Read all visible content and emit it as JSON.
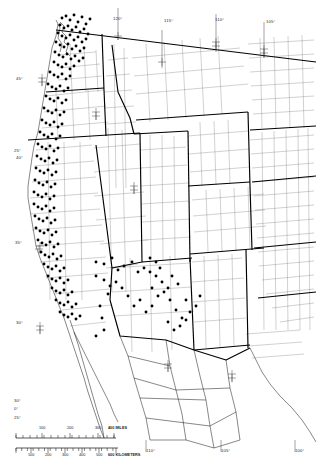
{
  "figure": {
    "name": "western-north-america-distribution-map",
    "background_color": "#ffffff",
    "ink_color": "#000000",
    "dot_color": "#000000"
  },
  "graticule": {
    "longitude_labels_top": [
      {
        "text": "120°",
        "x": 113,
        "y": 16
      },
      {
        "text": "115°",
        "x": 164,
        "y": 18
      },
      {
        "text": "110°",
        "x": 215,
        "y": 17
      },
      {
        "text": "105°",
        "x": 266,
        "y": 19
      }
    ],
    "longitude_labels_bottom": [
      {
        "text": "110°",
        "x": 146,
        "y": 448
      },
      {
        "text": "105°",
        "x": 221,
        "y": 448
      },
      {
        "text": "100°",
        "x": 295,
        "y": 448
      }
    ],
    "latitude_labels_left": [
      {
        "text": "45°",
        "x": 16,
        "y": 76
      },
      {
        "text": "25°",
        "x": 14,
        "y": 148
      },
      {
        "text": "40°",
        "x": 16,
        "y": 155
      },
      {
        "text": "35°",
        "x": 15,
        "y": 240
      },
      {
        "text": "30°",
        "x": 16,
        "y": 320
      },
      {
        "text": "30°",
        "x": 14,
        "y": 398
      },
      {
        "text": "0°",
        "x": 14,
        "y": 406
      },
      {
        "text": "25°",
        "x": 14,
        "y": 415
      }
    ],
    "tick_crosses": [
      {
        "x": 42,
        "y": 82
      },
      {
        "x": 118,
        "y": 36
      },
      {
        "x": 162,
        "y": 62
      },
      {
        "x": 216,
        "y": 46
      },
      {
        "x": 264,
        "y": 53
      },
      {
        "x": 40,
        "y": 330
      },
      {
        "x": 134,
        "y": 190
      },
      {
        "x": 168,
        "y": 368
      },
      {
        "x": 232,
        "y": 378
      },
      {
        "x": 39,
        "y": 249
      },
      {
        "x": 96,
        "y": 116
      }
    ]
  },
  "scale_bar": {
    "miles": {
      "unit_label": "400 MILES",
      "ticks": [
        "100",
        "200",
        "300"
      ],
      "tick_x": [
        28,
        56,
        84
      ],
      "end_x": 100
    },
    "kilometers": {
      "unit_label": "600 KILOMETERS",
      "ticks": [
        "100",
        "200",
        "300",
        "400",
        "500"
      ],
      "tick_x": [
        17,
        34,
        51,
        68,
        85
      ],
      "end_x": 102
    }
  },
  "chart_data": {
    "type": "scatter",
    "title": "",
    "xlabel": "Longitude",
    "ylabel": "Latitude",
    "xlim": [
      -127,
      -98
    ],
    "ylim": [
      24,
      50
    ],
    "grid": false,
    "legend": "none",
    "series": [
      {
        "name": "occurrence records",
        "marker": "filled circle",
        "color": "#000000",
        "points_pixel": [
          [
            62,
            18
          ],
          [
            66,
            16
          ],
          [
            70,
            20
          ],
          [
            74,
            15
          ],
          [
            78,
            22
          ],
          [
            82,
            17
          ],
          [
            86,
            24
          ],
          [
            90,
            19
          ],
          [
            60,
            25
          ],
          [
            64,
            28
          ],
          [
            68,
            26
          ],
          [
            72,
            30
          ],
          [
            76,
            27
          ],
          [
            80,
            32
          ],
          [
            84,
            29
          ],
          [
            88,
            34
          ],
          [
            58,
            33
          ],
          [
            62,
            36
          ],
          [
            66,
            38
          ],
          [
            70,
            35
          ],
          [
            74,
            40
          ],
          [
            78,
            37
          ],
          [
            82,
            42
          ],
          [
            86,
            39
          ],
          [
            56,
            42
          ],
          [
            60,
            45
          ],
          [
            64,
            47
          ],
          [
            68,
            44
          ],
          [
            72,
            49
          ],
          [
            76,
            46
          ],
          [
            80,
            51
          ],
          [
            84,
            48
          ],
          [
            55,
            52
          ],
          [
            59,
            55
          ],
          [
            63,
            57
          ],
          [
            67,
            54
          ],
          [
            71,
            59
          ],
          [
            75,
            56
          ],
          [
            79,
            61
          ],
          [
            83,
            58
          ],
          [
            54,
            62
          ],
          [
            58,
            65
          ],
          [
            62,
            67
          ],
          [
            66,
            64
          ],
          [
            70,
            69
          ],
          [
            74,
            66
          ],
          [
            50,
            72
          ],
          [
            54,
            75
          ],
          [
            58,
            77
          ],
          [
            62,
            74
          ],
          [
            66,
            79
          ],
          [
            70,
            76
          ],
          [
            48,
            84
          ],
          [
            52,
            87
          ],
          [
            56,
            89
          ],
          [
            60,
            86
          ],
          [
            64,
            91
          ],
          [
            68,
            88
          ],
          [
            46,
            96
          ],
          [
            50,
            99
          ],
          [
            54,
            101
          ],
          [
            58,
            98
          ],
          [
            62,
            103
          ],
          [
            66,
            100
          ],
          [
            44,
            108
          ],
          [
            48,
            111
          ],
          [
            52,
            113
          ],
          [
            56,
            110
          ],
          [
            60,
            115
          ],
          [
            64,
            112
          ],
          [
            42,
            120
          ],
          [
            46,
            123
          ],
          [
            50,
            125
          ],
          [
            54,
            122
          ],
          [
            58,
            127
          ],
          [
            62,
            124
          ],
          [
            40,
            132
          ],
          [
            44,
            135
          ],
          [
            48,
            137
          ],
          [
            52,
            134
          ],
          [
            56,
            139
          ],
          [
            60,
            136
          ],
          [
            38,
            144
          ],
          [
            42,
            147
          ],
          [
            46,
            149
          ],
          [
            50,
            146
          ],
          [
            54,
            151
          ],
          [
            58,
            148
          ],
          [
            37,
            156
          ],
          [
            41,
            159
          ],
          [
            45,
            161
          ],
          [
            49,
            158
          ],
          [
            53,
            163
          ],
          [
            57,
            160
          ],
          [
            36,
            168
          ],
          [
            40,
            171
          ],
          [
            44,
            173
          ],
          [
            48,
            170
          ],
          [
            52,
            175
          ],
          [
            56,
            172
          ],
          [
            35,
            180
          ],
          [
            39,
            183
          ],
          [
            43,
            185
          ],
          [
            47,
            182
          ],
          [
            51,
            187
          ],
          [
            55,
            184
          ],
          [
            34,
            192
          ],
          [
            38,
            195
          ],
          [
            42,
            197
          ],
          [
            46,
            194
          ],
          [
            50,
            199
          ],
          [
            54,
            196
          ],
          [
            34,
            204
          ],
          [
            38,
            207
          ],
          [
            42,
            209
          ],
          [
            46,
            206
          ],
          [
            50,
            211
          ],
          [
            54,
            208
          ],
          [
            35,
            216
          ],
          [
            39,
            219
          ],
          [
            43,
            221
          ],
          [
            47,
            218
          ],
          [
            51,
            223
          ],
          [
            55,
            220
          ],
          [
            36,
            228
          ],
          [
            40,
            231
          ],
          [
            44,
            233
          ],
          [
            48,
            230
          ],
          [
            52,
            235
          ],
          [
            56,
            232
          ],
          [
            38,
            240
          ],
          [
            42,
            243
          ],
          [
            46,
            245
          ],
          [
            50,
            242
          ],
          [
            54,
            247
          ],
          [
            58,
            244
          ],
          [
            41,
            252
          ],
          [
            45,
            255
          ],
          [
            49,
            257
          ],
          [
            53,
            254
          ],
          [
            57,
            259
          ],
          [
            61,
            256
          ],
          [
            44,
            264
          ],
          [
            48,
            267
          ],
          [
            52,
            269
          ],
          [
            56,
            266
          ],
          [
            60,
            271
          ],
          [
            64,
            268
          ],
          [
            48,
            276
          ],
          [
            52,
            279
          ],
          [
            56,
            281
          ],
          [
            60,
            278
          ],
          [
            64,
            283
          ],
          [
            68,
            280
          ],
          [
            52,
            288
          ],
          [
            56,
            291
          ],
          [
            60,
            293
          ],
          [
            64,
            290
          ],
          [
            68,
            295
          ],
          [
            72,
            292
          ],
          [
            56,
            300
          ],
          [
            60,
            303
          ],
          [
            64,
            305
          ],
          [
            68,
            302
          ],
          [
            72,
            307
          ],
          [
            76,
            304
          ],
          [
            60,
            312
          ],
          [
            64,
            315
          ],
          [
            68,
            317
          ],
          [
            72,
            314
          ],
          [
            76,
            319
          ],
          [
            80,
            316
          ],
          [
            96,
            262
          ],
          [
            104,
            264
          ],
          [
            112,
            258
          ],
          [
            96,
            276
          ],
          [
            104,
            280
          ],
          [
            108,
            294
          ],
          [
            100,
            306
          ],
          [
            102,
            318
          ],
          [
            104,
            330
          ],
          [
            96,
            336
          ],
          [
            118,
            270
          ],
          [
            124,
            266
          ],
          [
            132,
            262
          ],
          [
            138,
            272
          ],
          [
            144,
            268
          ],
          [
            150,
            258
          ],
          [
            156,
            276
          ],
          [
            160,
            268
          ],
          [
            152,
            288
          ],
          [
            158,
            296
          ],
          [
            164,
            292
          ],
          [
            170,
            300
          ],
          [
            176,
            310
          ],
          [
            182,
            318
          ],
          [
            168,
            322
          ],
          [
            174,
            330
          ],
          [
            180,
            326
          ],
          [
            186,
            320
          ],
          [
            152,
            306
          ],
          [
            146,
            312
          ],
          [
            140,
            300
          ],
          [
            134,
            306
          ],
          [
            128,
            296
          ],
          [
            122,
            288
          ],
          [
            116,
            282
          ],
          [
            110,
            286
          ],
          [
            150,
            272
          ],
          [
            156,
            262
          ],
          [
            162,
            282
          ],
          [
            168,
            288
          ],
          [
            172,
            276
          ],
          [
            178,
            284
          ],
          [
            186,
            300
          ],
          [
            190,
            312
          ],
          [
            196,
            306
          ],
          [
            200,
            296
          ]
        ],
        "description": "Dense records along Pacific coast ranges, Sierra Nevada, Puget Sound; scattered records across Nevada, Arizona and New Mexico"
      }
    ]
  },
  "regions": {
    "states_with_counties": [
      "Washington",
      "Oregon",
      "California",
      "Idaho",
      "Nevada",
      "Utah",
      "Arizona",
      "Montana",
      "Wyoming",
      "Colorado",
      "New Mexico",
      "Nebraska",
      "Kansas",
      "Oklahoma",
      "Texas",
      "North Dakota",
      "South Dakota"
    ],
    "countries": [
      "United States",
      "Mexico"
    ]
  }
}
